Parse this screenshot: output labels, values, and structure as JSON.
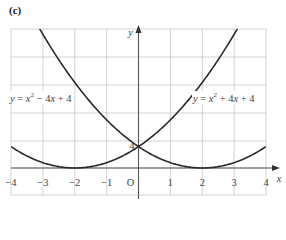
{
  "part_label": "(c)",
  "chart_data": {
    "type": "line",
    "title": "",
    "xlabel": "x",
    "ylabel": "y",
    "origin_label": "O",
    "xlim": [
      -4,
      4
    ],
    "ylim": [
      0,
      26
    ],
    "x_ticks": [
      -4,
      -3,
      -2,
      -1,
      1,
      2,
      3,
      4
    ],
    "x_tick_labels": [
      "−4",
      "−3",
      "−2",
      "−1",
      "1",
      "2",
      "3",
      "4"
    ],
    "y_ticks": [
      4
    ],
    "y_tick_labels": [
      "4"
    ],
    "grid": true,
    "series": [
      {
        "name": "y = x² − 4x + 4",
        "label_parts": [
          "y",
          " = ",
          "x",
          "²",
          " − 4",
          "x",
          " + 4"
        ],
        "equation": "x^2 - 4x + 4",
        "vertex": [
          2,
          0
        ],
        "y_intercept": 4,
        "x": [
          -4,
          -3,
          -2,
          -1,
          0,
          1,
          2,
          3,
          4
        ],
        "values": [
          36,
          25,
          16,
          9,
          4,
          1,
          0,
          1,
          4
        ]
      },
      {
        "name": "y = x² + 4x + 4",
        "label_parts": [
          "y",
          " = ",
          "x",
          "²",
          " + 4",
          "x",
          " + 4"
        ],
        "equation": "x^2 + 4x + 4",
        "vertex": [
          -2,
          0
        ],
        "y_intercept": 4,
        "x": [
          -4,
          -3,
          -2,
          -1,
          0,
          1,
          2,
          3,
          4
        ],
        "values": [
          4,
          1,
          0,
          1,
          4,
          9,
          16,
          25,
          36
        ]
      }
    ],
    "annotations": [
      {
        "text": "4",
        "at": [
          0,
          4
        ],
        "note": "intersection of both curves on y-axis"
      }
    ]
  }
}
